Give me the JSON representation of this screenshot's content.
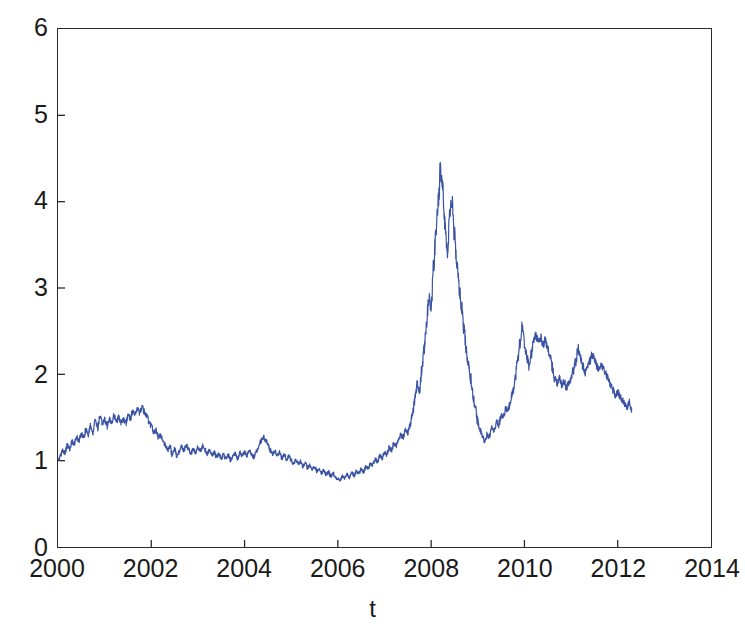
{
  "figure": {
    "background_color": "#ffffff",
    "axis_color": "#2b2b2b",
    "text_color": "#1a1a1a"
  },
  "chart_data": {
    "type": "line",
    "title": "",
    "subtitle": "",
    "xlabel": "t",
    "ylabel": "",
    "xlim": [
      2000,
      2014
    ],
    "ylim": [
      0,
      6
    ],
    "xticks": [
      2000,
      2002,
      2004,
      2006,
      2008,
      2010,
      2012,
      2014
    ],
    "xtick_labels": [
      "2000",
      "2002",
      "2004",
      "2006",
      "2008",
      "2010",
      "2012",
      "2014"
    ],
    "yticks": [
      0,
      1,
      2,
      3,
      4,
      5,
      6
    ],
    "ytick_labels": [
      "0",
      "1",
      "2",
      "3",
      "4",
      "5",
      "6"
    ],
    "grid": false,
    "legend": false,
    "legend_position": "none",
    "annotations": [],
    "series": [
      {
        "name": "series-1",
        "color": "#3a53a4",
        "line_width": 1.2,
        "marker": "none",
        "x_start": 2000.0,
        "x_end": 2012.3,
        "n_points": 248,
        "sampling": "approximately monthly (irregular daily-style volatility)",
        "x": [
          2000.0,
          2000.05,
          2000.1,
          2000.15,
          2000.2,
          2000.25,
          2000.3,
          2000.35,
          2000.4,
          2000.45,
          2000.5,
          2000.55,
          2000.6,
          2000.65,
          2000.7,
          2000.75,
          2000.8,
          2000.85,
          2000.9,
          2000.95,
          2001.0,
          2001.05,
          2001.1,
          2001.15,
          2001.2,
          2001.25,
          2001.3,
          2001.35,
          2001.4,
          2001.45,
          2001.5,
          2001.55,
          2001.6,
          2001.65,
          2001.7,
          2001.75,
          2001.8,
          2001.85,
          2001.9,
          2001.95,
          2002.0,
          2002.05,
          2002.1,
          2002.15,
          2002.2,
          2002.25,
          2002.3,
          2002.35,
          2002.4,
          2002.45,
          2002.5,
          2002.55,
          2002.6,
          2002.65,
          2002.7,
          2002.75,
          2002.8,
          2002.85,
          2002.9,
          2002.95,
          2003.0,
          2003.05,
          2003.1,
          2003.15,
          2003.2,
          2003.25,
          2003.3,
          2003.35,
          2003.4,
          2003.45,
          2003.5,
          2003.55,
          2003.6,
          2003.65,
          2003.7,
          2003.75,
          2003.8,
          2003.85,
          2003.9,
          2003.95,
          2004.0,
          2004.05,
          2004.1,
          2004.15,
          2004.2,
          2004.25,
          2004.3,
          2004.35,
          2004.4,
          2004.45,
          2004.5,
          2004.55,
          2004.6,
          2004.65,
          2004.7,
          2004.75,
          2004.8,
          2004.85,
          2004.9,
          2004.95,
          2005.0,
          2005.05,
          2005.1,
          2005.15,
          2005.2,
          2005.25,
          2005.3,
          2005.35,
          2005.4,
          2005.45,
          2005.5,
          2005.55,
          2005.6,
          2005.65,
          2005.7,
          2005.75,
          2005.8,
          2005.85,
          2005.9,
          2005.95,
          2006.0,
          2006.05,
          2006.1,
          2006.15,
          2006.2,
          2006.25,
          2006.3,
          2006.35,
          2006.4,
          2006.45,
          2006.5,
          2006.55,
          2006.6,
          2006.65,
          2006.7,
          2006.75,
          2006.8,
          2006.85,
          2006.9,
          2006.95,
          2007.0,
          2007.05,
          2007.1,
          2007.15,
          2007.2,
          2007.25,
          2007.3,
          2007.35,
          2007.4,
          2007.45,
          2007.5,
          2007.55,
          2007.6,
          2007.65,
          2007.7,
          2007.75,
          2007.8,
          2007.85,
          2007.9,
          2007.95,
          2008.0,
          2008.05,
          2008.1,
          2008.15,
          2008.2,
          2008.25,
          2008.3,
          2008.35,
          2008.4,
          2008.45,
          2008.5,
          2008.55,
          2008.6,
          2008.65,
          2008.7,
          2008.75,
          2008.8,
          2008.85,
          2008.9,
          2008.95,
          2009.0,
          2009.05,
          2009.1,
          2009.15,
          2009.2,
          2009.25,
          2009.3,
          2009.35,
          2009.4,
          2009.45,
          2009.5,
          2009.55,
          2009.6,
          2009.65,
          2009.7,
          2009.75,
          2009.8,
          2009.85,
          2009.9,
          2009.95,
          2010.0,
          2010.05,
          2010.1,
          2010.15,
          2010.2,
          2010.25,
          2010.3,
          2010.35,
          2010.4,
          2010.45,
          2010.5,
          2010.55,
          2010.6,
          2010.65,
          2010.7,
          2010.75,
          2010.8,
          2010.85,
          2010.9,
          2010.95,
          2011.0,
          2011.05,
          2011.1,
          2011.15,
          2011.2,
          2011.25,
          2011.3,
          2011.35,
          2011.4,
          2011.45,
          2011.5,
          2011.55,
          2011.6,
          2011.65,
          2011.7,
          2011.75,
          2011.8,
          2011.85,
          2011.9,
          2011.95,
          2012.0,
          2012.05,
          2012.1,
          2012.15,
          2012.2,
          2012.25,
          2012.3
        ],
        "y": [
          1.0,
          1.05,
          1.12,
          1.09,
          1.18,
          1.14,
          1.22,
          1.19,
          1.27,
          1.23,
          1.31,
          1.26,
          1.36,
          1.31,
          1.41,
          1.33,
          1.46,
          1.38,
          1.5,
          1.43,
          1.47,
          1.4,
          1.49,
          1.44,
          1.52,
          1.45,
          1.5,
          1.44,
          1.48,
          1.43,
          1.53,
          1.49,
          1.57,
          1.53,
          1.6,
          1.56,
          1.62,
          1.57,
          1.52,
          1.45,
          1.4,
          1.33,
          1.35,
          1.28,
          1.3,
          1.22,
          1.18,
          1.12,
          1.16,
          1.07,
          1.13,
          1.05,
          1.1,
          1.16,
          1.12,
          1.18,
          1.13,
          1.08,
          1.14,
          1.09,
          1.16,
          1.11,
          1.17,
          1.13,
          1.08,
          1.12,
          1.06,
          1.1,
          1.04,
          1.08,
          1.03,
          1.07,
          1.02,
          1.06,
          1.01,
          1.05,
          1.08,
          1.03,
          1.09,
          1.05,
          1.1,
          1.06,
          1.12,
          1.07,
          1.04,
          1.1,
          1.16,
          1.22,
          1.28,
          1.24,
          1.18,
          1.12,
          1.07,
          1.11,
          1.05,
          1.09,
          1.03,
          1.07,
          1.01,
          1.05,
          1.0,
          0.97,
          1.01,
          0.96,
          0.99,
          0.94,
          0.97,
          0.92,
          0.95,
          0.9,
          0.93,
          0.88,
          0.91,
          0.86,
          0.89,
          0.84,
          0.87,
          0.82,
          0.85,
          0.8,
          0.79,
          0.78,
          0.82,
          0.8,
          0.84,
          0.81,
          0.86,
          0.83,
          0.88,
          0.85,
          0.9,
          0.87,
          0.93,
          0.91,
          0.97,
          0.95,
          1.02,
          0.99,
          1.06,
          1.03,
          1.1,
          1.07,
          1.15,
          1.12,
          1.2,
          1.17,
          1.25,
          1.3,
          1.27,
          1.35,
          1.32,
          1.42,
          1.55,
          1.7,
          1.9,
          1.8,
          2.05,
          2.3,
          2.55,
          2.9,
          2.75,
          3.2,
          3.6,
          3.95,
          4.38,
          4.1,
          3.7,
          3.45,
          3.9,
          4.0,
          3.6,
          3.3,
          3.0,
          2.8,
          2.55,
          2.3,
          2.1,
          1.95,
          1.75,
          1.6,
          1.45,
          1.35,
          1.28,
          1.22,
          1.3,
          1.27,
          1.38,
          1.35,
          1.45,
          1.42,
          1.52,
          1.5,
          1.6,
          1.58,
          1.7,
          1.8,
          1.95,
          2.15,
          2.35,
          2.55,
          2.35,
          2.2,
          2.1,
          2.25,
          2.4,
          2.45,
          2.38,
          2.42,
          2.35,
          2.4,
          2.3,
          2.2,
          2.08,
          1.95,
          1.9,
          1.95,
          1.88,
          1.92,
          1.85,
          1.9,
          1.95,
          2.05,
          2.15,
          2.3,
          2.2,
          2.1,
          2.02,
          2.08,
          2.15,
          2.22,
          2.18,
          2.1,
          2.05,
          2.12,
          2.06,
          2.0,
          1.95,
          1.88,
          1.82,
          1.75,
          1.8,
          1.74,
          1.7,
          1.66,
          1.62,
          1.68,
          1.6
        ],
        "key_features": {
          "start_value": 1.0,
          "end_value": 1.6,
          "max_value": 4.38,
          "max_x": 2008.2,
          "min_value": 0.78,
          "min_x": 2005.85,
          "local_peak_2001": 1.62,
          "local_peak_2004": 1.28,
          "secondary_peak_2008": 4.0,
          "crash_trough_2009": 1.22,
          "recovery_peak_2009": 2.55,
          "peak_2010": 2.45,
          "peak_2011": 2.3
        }
      }
    ]
  }
}
